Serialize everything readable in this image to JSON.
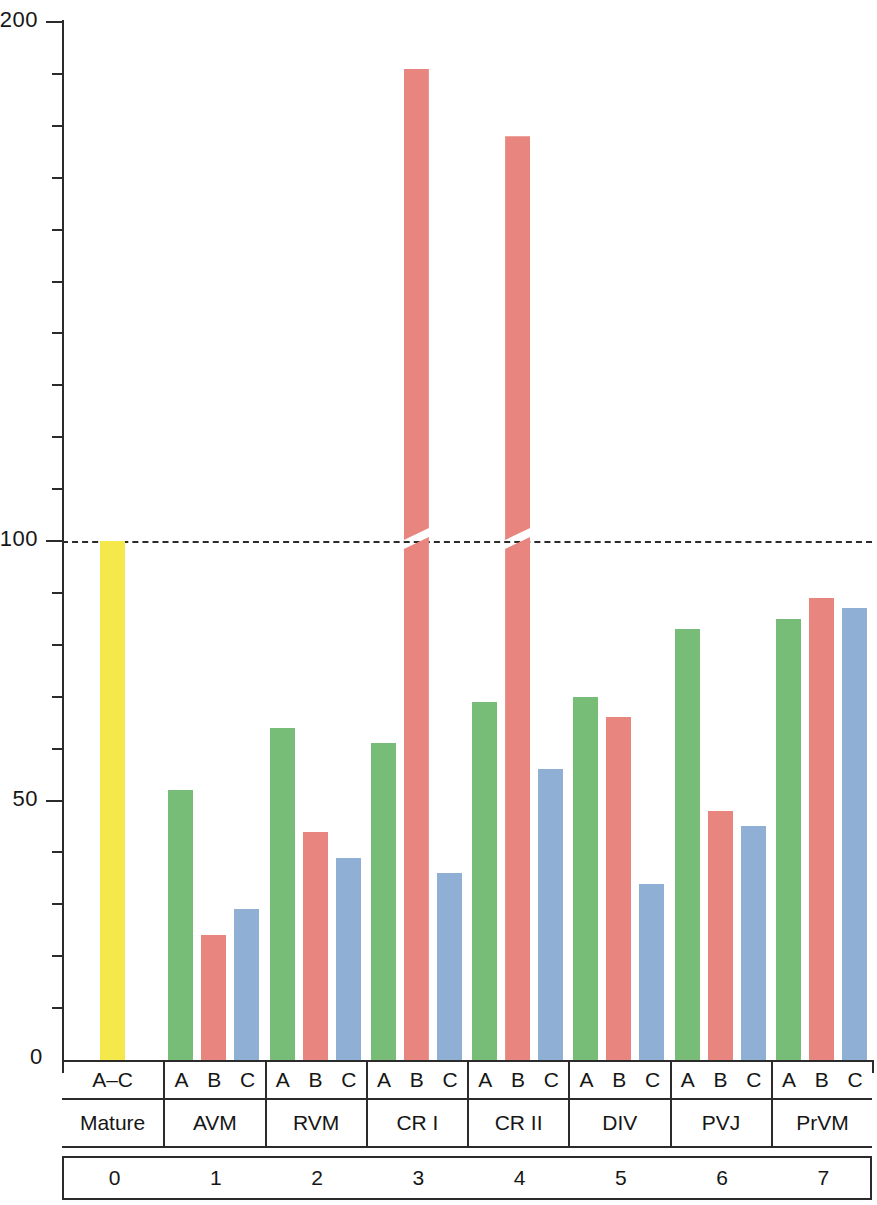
{
  "chart_data": {
    "type": "bar",
    "title": "",
    "xlabel": "",
    "ylabel": "",
    "ylim": [
      0,
      200
    ],
    "grid": false,
    "legend_position": "none",
    "y_ticks_major": [
      0,
      50,
      100,
      200
    ],
    "y_tick_labels": [
      "0",
      "50",
      "100",
      "200"
    ],
    "y_ticks_minor": [
      10,
      20,
      30,
      40,
      60,
      70,
      80,
      90,
      110,
      120,
      130,
      140,
      150,
      160,
      170,
      180,
      190
    ],
    "reference_line": {
      "value": 100,
      "style": "dashed"
    },
    "axis_break": {
      "at": 100,
      "note": "bars exceeding 100 are drawn with a slanted break at the 100 line"
    },
    "series_names": [
      "A",
      "B",
      "C"
    ],
    "series_colors": {
      "A": "#77bd77",
      "B": "#e8857f",
      "C": "#8fafd4",
      "Mature": "#f5e84a"
    },
    "categories": [
      "Mature",
      "AVM",
      "RVM",
      "CR I",
      "CR II",
      "DIV",
      "PVJ",
      "PrVM"
    ],
    "category_indices": [
      "0",
      "1",
      "2",
      "3",
      "4",
      "5",
      "6",
      "7"
    ],
    "groups": [
      {
        "name": "Mature",
        "index": "0",
        "sublabel": "A–C",
        "bars": [
          {
            "label": "A–C",
            "value": 100,
            "color": "#f5e84a",
            "broken": false
          }
        ]
      },
      {
        "name": "AVM",
        "index": "1",
        "sublabel": "A B C",
        "bars": [
          {
            "label": "A",
            "value": 52,
            "color": "#77bd77",
            "broken": false
          },
          {
            "label": "B",
            "value": 24,
            "color": "#e8857f",
            "broken": false
          },
          {
            "label": "C",
            "value": 29,
            "color": "#8fafd4",
            "broken": false
          }
        ]
      },
      {
        "name": "RVM",
        "index": "2",
        "sublabel": "A B C",
        "bars": [
          {
            "label": "A",
            "value": 64,
            "color": "#77bd77",
            "broken": false
          },
          {
            "label": "B",
            "value": 44,
            "color": "#e8857f",
            "broken": false
          },
          {
            "label": "C",
            "value": 39,
            "color": "#8fafd4",
            "broken": false
          }
        ]
      },
      {
        "name": "CR I",
        "index": "3",
        "sublabel": "A B C",
        "bars": [
          {
            "label": "A",
            "value": 61,
            "color": "#77bd77",
            "broken": false
          },
          {
            "label": "B",
            "value": 191,
            "color": "#e8857f",
            "broken": true
          },
          {
            "label": "C",
            "value": 36,
            "color": "#8fafd4",
            "broken": false
          }
        ]
      },
      {
        "name": "CR II",
        "index": "4",
        "sublabel": "A B C",
        "bars": [
          {
            "label": "A",
            "value": 69,
            "color": "#77bd77",
            "broken": false
          },
          {
            "label": "B",
            "value": 178,
            "color": "#e8857f",
            "broken": true
          },
          {
            "label": "C",
            "value": 56,
            "color": "#8fafd4",
            "broken": false
          }
        ]
      },
      {
        "name": "DIV",
        "index": "5",
        "sublabel": "A B C",
        "bars": [
          {
            "label": "A",
            "value": 70,
            "color": "#77bd77",
            "broken": false
          },
          {
            "label": "B",
            "value": 66,
            "color": "#e8857f",
            "broken": false
          },
          {
            "label": "C",
            "value": 34,
            "color": "#8fafd4",
            "broken": false
          }
        ]
      },
      {
        "name": "PVJ",
        "index": "6",
        "sublabel": "A B C",
        "bars": [
          {
            "label": "A",
            "value": 83,
            "color": "#77bd77",
            "broken": false
          },
          {
            "label": "B",
            "value": 48,
            "color": "#e8857f",
            "broken": false
          },
          {
            "label": "C",
            "value": 45,
            "color": "#8fafd4",
            "broken": false
          }
        ]
      },
      {
        "name": "PrVM",
        "index": "7",
        "sublabel": "A B C",
        "bars": [
          {
            "label": "A",
            "value": 85,
            "color": "#77bd77",
            "broken": false
          },
          {
            "label": "B",
            "value": 89,
            "color": "#e8857f",
            "broken": false
          },
          {
            "label": "C",
            "value": 87,
            "color": "#8fafd4",
            "broken": false
          }
        ]
      }
    ]
  }
}
